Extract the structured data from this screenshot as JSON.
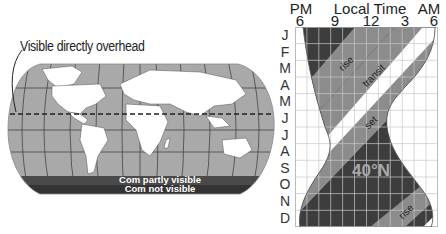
{
  "map": {
    "callout_label": "Visible directly overhead",
    "band_labels": [
      "Com partly visible",
      "Com not visible"
    ],
    "colors": {
      "ocean": "#a9a9a9",
      "land": "#ffffff",
      "partly": "#4a4a4a",
      "not": "#333333",
      "dashed": "#222222"
    }
  },
  "chart": {
    "header": {
      "left_ampm": "PM",
      "title": "Local Time",
      "right_ampm": "AM",
      "hours": [
        "6",
        "9",
        "12",
        "3",
        "6"
      ]
    },
    "months": [
      "J",
      "F",
      "M",
      "A",
      "M",
      "J",
      "J",
      "A",
      "S",
      "O",
      "N",
      "D"
    ],
    "bands": {
      "rise_top": "rise",
      "transit": "transit",
      "set": "set",
      "rise_bottom": "rise"
    },
    "latitude_label": "40°N",
    "colors": {
      "night_dark": "#3d3d3d",
      "mid": "#8c8c8c",
      "transit": "#ffffff",
      "grid": "#d0d0d0"
    }
  }
}
